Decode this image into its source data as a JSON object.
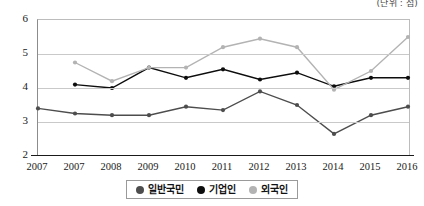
{
  "unit_caption": "(단위 : 점)",
  "legend": {
    "position": "bottom-center",
    "items": [
      {
        "label": "일반국민",
        "color": "#4d4d4d"
      },
      {
        "label": "기업인",
        "color": "#0d0d0d"
      },
      {
        "label": "외국인",
        "color": "#b3b3b3"
      }
    ]
  },
  "chart_data": {
    "type": "line",
    "title": "",
    "xlabel": "",
    "ylabel": "",
    "ylim": [
      2,
      6
    ],
    "yticks": [
      2,
      3,
      4,
      5,
      6
    ],
    "grid": true,
    "unit": "점",
    "categories": [
      "2007",
      "2007",
      "2008",
      "2009",
      "2010",
      "2011",
      "2012",
      "2013",
      "2014",
      "2015",
      "2016"
    ],
    "series": [
      {
        "name": "일반국민",
        "color": "#4d4d4d",
        "values": [
          3.4,
          3.25,
          3.2,
          3.2,
          3.45,
          3.35,
          3.9,
          3.5,
          2.65,
          3.2,
          3.45
        ]
      },
      {
        "name": "기업인",
        "color": "#0d0d0d",
        "values": [
          null,
          4.1,
          4.0,
          4.6,
          4.3,
          4.55,
          4.25,
          4.45,
          4.05,
          4.3,
          4.3
        ]
      },
      {
        "name": "외국인",
        "color": "#b3b3b3",
        "values": [
          null,
          4.75,
          4.2,
          4.6,
          4.6,
          5.2,
          5.45,
          5.2,
          3.95,
          4.5,
          5.5
        ]
      }
    ]
  }
}
